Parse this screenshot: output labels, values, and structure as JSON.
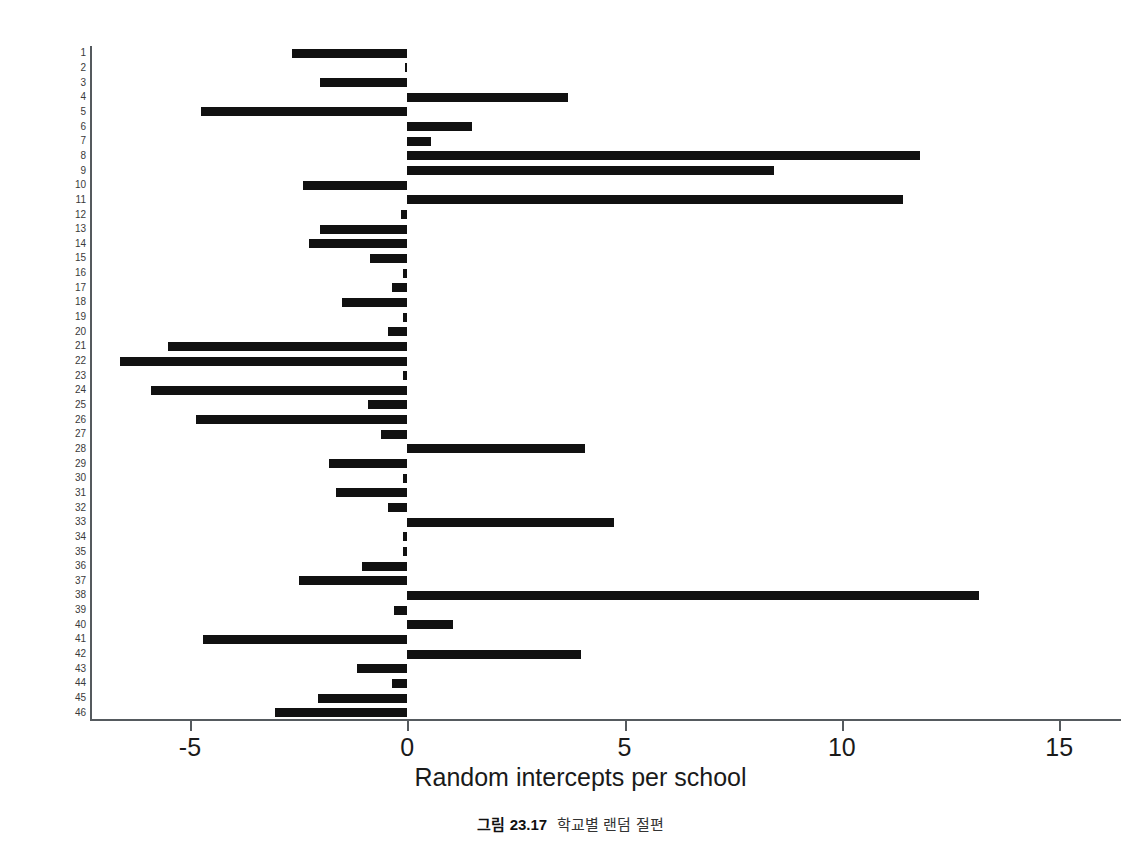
{
  "figure": {
    "caption_number": "그림 23.17",
    "caption_text": "학교별 랜덤 절편"
  },
  "chart_data": {
    "type": "bar",
    "orientation": "horizontal",
    "title": "",
    "xlabel": "Random intercepts per school",
    "ylabel": "",
    "xlim": [
      -7.3,
      16.4
    ],
    "ylim": [
      0.5,
      46.5
    ],
    "xticks": [
      -5,
      0,
      5,
      10,
      15
    ],
    "xtick_labels": [
      "-5",
      "0",
      "5",
      "10",
      "15"
    ],
    "grid": false,
    "legend": null,
    "bar_color": "#111111",
    "axis_color": "#555a5e",
    "categories": [
      "1",
      "2",
      "3",
      "4",
      "5",
      "6",
      "7",
      "8",
      "9",
      "10",
      "11",
      "12",
      "13",
      "14",
      "15",
      "16",
      "17",
      "18",
      "19",
      "20",
      "21",
      "22",
      "23",
      "24",
      "25",
      "26",
      "27",
      "28",
      "29",
      "30",
      "31",
      "32",
      "33",
      "34",
      "35",
      "36",
      "37",
      "38",
      "39",
      "40",
      "41",
      "42",
      "43",
      "44",
      "45",
      "46"
    ],
    "values": [
      -2.65,
      -0.05,
      -2.0,
      3.7,
      -4.75,
      1.5,
      0.55,
      11.8,
      8.45,
      -2.4,
      11.4,
      -0.15,
      -2.0,
      -2.25,
      -0.85,
      -0.1,
      -0.35,
      -1.5,
      -0.1,
      -0.45,
      -5.5,
      -6.6,
      -0.1,
      -5.9,
      -0.9,
      -4.85,
      -0.6,
      4.1,
      -1.8,
      -0.1,
      -1.65,
      -0.45,
      4.75,
      -0.1,
      -0.1,
      -1.05,
      -2.5,
      13.15,
      -0.3,
      1.05,
      -4.7,
      4.0,
      -1.15,
      -0.35,
      -2.05,
      -3.05
    ]
  }
}
